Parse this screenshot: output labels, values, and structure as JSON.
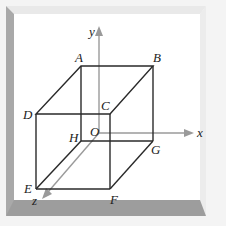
{
  "diagram": {
    "type": "3d-cube-with-axes",
    "colors": {
      "background": "#ffffff",
      "frame_light": "#e6e6e6",
      "frame_dark": "#9a9a9a",
      "edge": "#2a2a2a",
      "axis": "#999999"
    },
    "vertices": {
      "A": {
        "label": "A",
        "x": 81,
        "y": 66
      },
      "B": {
        "label": "B",
        "x": 153,
        "y": 66
      },
      "C": {
        "label": "C",
        "x": 110,
        "y": 114
      },
      "D": {
        "label": "D",
        "x": 36,
        "y": 114
      },
      "E": {
        "label": "E",
        "x": 36,
        "y": 189
      },
      "F": {
        "label": "F",
        "x": 110,
        "y": 189
      },
      "G": {
        "label": "G",
        "x": 153,
        "y": 141
      },
      "H": {
        "label": "H",
        "x": 81,
        "y": 141
      }
    },
    "origin": {
      "label": "O"
    },
    "axes": {
      "x": {
        "label": "x"
      },
      "y": {
        "label": "y"
      },
      "z": {
        "label": "z"
      }
    }
  }
}
